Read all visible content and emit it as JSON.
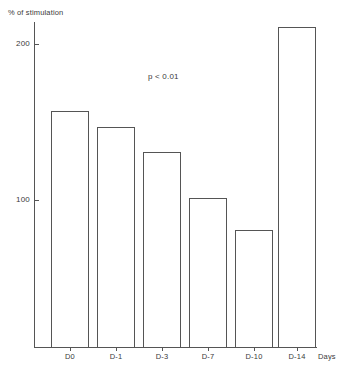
{
  "chart_data": {
    "type": "bar",
    "title": "",
    "subtitle": "",
    "ylabel": "% of stimulation",
    "xlabel": "Days",
    "categories": [
      "D0",
      "D-1",
      "D-3",
      "D-7",
      "D-10",
      "D-14"
    ],
    "values": [
      151,
      141,
      129,
      101,
      82,
      211
    ],
    "series": [
      {
        "name": "% of stimulation",
        "values": [
          151,
          141,
          129,
          101,
          82,
          211
        ]
      }
    ],
    "ylim": [
      0,
      222
    ],
    "y_ticks": [
      100,
      200
    ],
    "y_tick_labels": [
      "100",
      "200"
    ],
    "grid": false,
    "legend": "none",
    "annotations": [
      {
        "name": "p-value",
        "text": "p < 0.01",
        "x_px": 148,
        "y_px": 72
      }
    ],
    "bar_style": {
      "fill": "#ffffff",
      "stroke": "#555555",
      "stroke_width_px": 1
    }
  },
  "axis": {
    "y_title": "% of stimulation",
    "x_title": "Days",
    "tick_200": "200",
    "tick_100": "100"
  },
  "bars": [
    {
      "label": "D0",
      "value": 151,
      "left_px": 51,
      "width_px": 38,
      "top_px": 111
    },
    {
      "label": "D-1",
      "value": 141,
      "left_px": 97,
      "width_px": 38,
      "top_px": 127
    },
    {
      "label": "D-3",
      "value": 129,
      "left_px": 143,
      "width_px": 38,
      "top_px": 152
    },
    {
      "label": "D-7",
      "value": 101,
      "left_px": 189,
      "width_px": 38,
      "top_px": 198
    },
    {
      "label": "D-10",
      "value": 82,
      "left_px": 235,
      "width_px": 38,
      "top_px": 230
    },
    {
      "label": "D-14",
      "value": 211,
      "left_px": 278,
      "width_px": 38,
      "top_px": 27
    }
  ],
  "annotation": {
    "p_value": "p < 0.01"
  }
}
